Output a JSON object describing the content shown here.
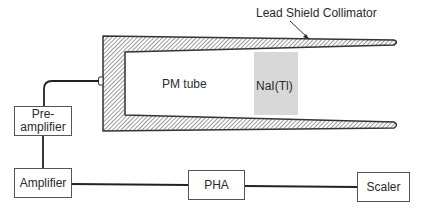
{
  "diagram": {
    "title_label": "Lead Shield Collimator",
    "detector": {
      "pm_tube_label": "PM tube",
      "crystal_label": "NaI(Tl)",
      "crystal_color": "#d8d8d8"
    },
    "blocks": [
      {
        "id": "preamp",
        "line1": "Pre-",
        "line2": "amplifier"
      },
      {
        "id": "amplifier",
        "label": "Amplifier"
      },
      {
        "id": "pha",
        "label": "PHA"
      },
      {
        "id": "scaler",
        "label": "Scaler"
      }
    ],
    "colors": {
      "stroke": "#333333",
      "hatch": "#555555",
      "background": "#ffffff"
    }
  }
}
